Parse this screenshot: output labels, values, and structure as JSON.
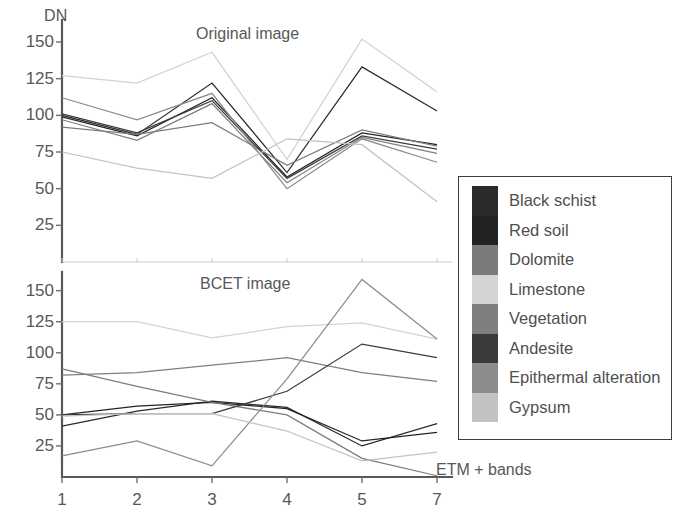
{
  "figure": {
    "y_axis_label": "DN",
    "x_axis_label": "ETM + bands"
  },
  "legend": {
    "entries": [
      {
        "label": "Black schist",
        "color": "#2a2a2a"
      },
      {
        "label": "Red soil",
        "color": "#232323"
      },
      {
        "label": "Dolomite",
        "color": "#7b7b7b"
      },
      {
        "label": "Limestone",
        "color": "#d3d3d3"
      },
      {
        "label": "Vegetation",
        "color": "#7f7f7f"
      },
      {
        "label": "Andesite",
        "color": "#3b3b3b"
      },
      {
        "label": "Epithermal alteration",
        "color": "#8c8c8c"
      },
      {
        "label": "Gypsum",
        "color": "#c2c2c2"
      }
    ]
  },
  "chart_data": [
    {
      "type": "line",
      "title": "Original image",
      "panel": "top",
      "xlabel": "ETM + bands",
      "ylabel": "DN",
      "categories": [
        "1",
        "2",
        "3",
        "4",
        "5",
        "7"
      ],
      "yticks": [
        25,
        50,
        75,
        100,
        125,
        150
      ],
      "ylim": [
        0,
        165
      ],
      "grid": false,
      "legend_position": "right-external",
      "series": [
        {
          "name": "Black schist",
          "color": "#2a2a2a",
          "values": [
            100,
            87,
            122,
            61,
            133,
            103
          ]
        },
        {
          "name": "Red soil",
          "color": "#232323",
          "values": [
            99,
            86,
            112,
            58,
            88,
            80
          ]
        },
        {
          "name": "Dolomite",
          "color": "#7b7b7b",
          "values": [
            92,
            87,
            95,
            66,
            90,
            79
          ]
        },
        {
          "name": "Limestone",
          "color": "#d3d3d3",
          "values": [
            127,
            122,
            143,
            70,
            152,
            116
          ]
        },
        {
          "name": "Vegetation",
          "color": "#7f7f7f",
          "values": [
            97,
            83,
            108,
            54,
            85,
            74
          ]
        },
        {
          "name": "Andesite",
          "color": "#3b3b3b",
          "values": [
            101,
            88,
            110,
            57,
            86,
            77
          ]
        },
        {
          "name": "Epithermal alteration",
          "color": "#8c8c8c",
          "values": [
            112,
            97,
            115,
            50,
            84,
            68
          ]
        },
        {
          "name": "Gypsum",
          "color": "#c2c2c2",
          "values": [
            75,
            64,
            57,
            84,
            80,
            41
          ]
        }
      ]
    },
    {
      "type": "line",
      "title": "BCET image",
      "panel": "bottom",
      "xlabel": "ETM + bands",
      "ylabel": "DN",
      "categories": [
        "1",
        "2",
        "3",
        "4",
        "5",
        "7"
      ],
      "yticks": [
        25,
        50,
        75,
        100,
        125,
        150
      ],
      "ylim": [
        0,
        165
      ],
      "grid": false,
      "legend_position": "right-external",
      "series": [
        {
          "name": "Black schist",
          "color": "#2a2a2a",
          "values": [
            41,
            53,
            61,
            56,
            25,
            43
          ]
        },
        {
          "name": "Red soil",
          "color": "#232323",
          "values": [
            50,
            57,
            60,
            55,
            29,
            36
          ]
        },
        {
          "name": "Dolomite",
          "color": "#7b7b7b",
          "values": [
            87,
            73,
            60,
            50,
            15,
            1
          ]
        },
        {
          "name": "Limestone",
          "color": "#d3d3d3",
          "values": [
            125,
            125,
            112,
            121,
            124,
            111
          ]
        },
        {
          "name": "Vegetation",
          "color": "#7f7f7f",
          "values": [
            82,
            84,
            90,
            96,
            84,
            77
          ]
        },
        {
          "name": "Andesite",
          "color": "#3b3b3b",
          "values": [
            50,
            51,
            51,
            69,
            107,
            96
          ]
        },
        {
          "name": "Epithermal alteration",
          "color": "#8c8c8c",
          "values": [
            17,
            29,
            9,
            79,
            159,
            111
          ]
        },
        {
          "name": "Gypsum",
          "color": "#c2c2c2",
          "values": [
            49,
            51,
            51,
            37,
            13,
            20
          ]
        }
      ]
    }
  ]
}
